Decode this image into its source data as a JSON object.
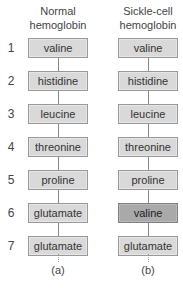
{
  "columns": [
    {
      "title_line1": "Normal",
      "title_line2": "hemoglobin",
      "label": "(a)",
      "residues": [
        "valine",
        "histidine",
        "leucine",
        "threonine",
        "proline",
        "glutamate",
        "glutamate"
      ]
    },
    {
      "title_line1": "Sickle-cell",
      "title_line2": "hemoglobin",
      "label": "(b)",
      "residues": [
        "valine",
        "histidine",
        "leucine",
        "threonine",
        "proline",
        "valine",
        "glutamate"
      ]
    }
  ],
  "positions": [
    "1",
    "2",
    "3",
    "4",
    "5",
    "6",
    "7"
  ],
  "highlighted": {
    "column": 1,
    "position": 6
  },
  "colors": {
    "box": "#d9d9d9",
    "mutated_box": "#a9a9a9"
  }
}
